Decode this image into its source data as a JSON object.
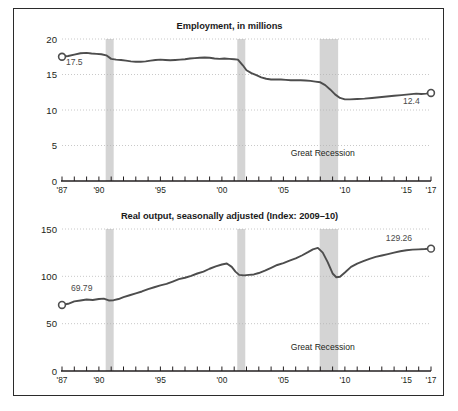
{
  "figure": {
    "background": "#ffffff",
    "frame_color": "#2b2b2b",
    "line_color": "#4d4d4d",
    "recession_band_color": "#d4d4d4",
    "grid_color": "#b3b3b3"
  },
  "chart_data": [
    {
      "id": "employment",
      "type": "line",
      "title": "Employment, in millions",
      "xlabel": "",
      "ylabel": "",
      "xlim": [
        1987,
        2017
      ],
      "ylim": [
        0,
        20
      ],
      "yticks": [
        0,
        5,
        10,
        15,
        20
      ],
      "ytick_labels": [
        "0",
        "5",
        "10",
        "15",
        "20"
      ],
      "xticks": [
        1987,
        1988,
        1989,
        1990,
        1991,
        1992,
        1993,
        1994,
        1995,
        1996,
        1997,
        1998,
        1999,
        2000,
        2001,
        2002,
        2003,
        2004,
        2005,
        2006,
        2007,
        2008,
        2009,
        2010,
        2011,
        2012,
        2013,
        2014,
        2015,
        2016,
        2017
      ],
      "xtick_labels": [
        {
          "x": 1987,
          "label": "'87"
        },
        {
          "x": 1990,
          "label": "'90"
        },
        {
          "x": 1995,
          "label": "'95"
        },
        {
          "x": 2000,
          "label": "'00"
        },
        {
          "x": 2005,
          "label": "'05"
        },
        {
          "x": 2010,
          "label": "'10"
        },
        {
          "x": 2015,
          "label": "'15"
        },
        {
          "x": 2017,
          "label": "'17"
        }
      ],
      "grid": "horizontal-dotted",
      "legend": "none",
      "annotations": [
        {
          "name": "start-value",
          "text": "17.5",
          "x": 1988.0,
          "y": 16.3,
          "anchor": "middle"
        },
        {
          "name": "end-value",
          "text": "12.4",
          "x": 2015.4,
          "y": 10.8,
          "anchor": "middle"
        },
        {
          "name": "recession-label",
          "text": "Great Recession",
          "x": 2008.2,
          "y": 3.5,
          "anchor": "middle"
        }
      ],
      "markers": [
        {
          "name": "start-marker",
          "x": 1987.0,
          "y": 17.5
        },
        {
          "name": "end-marker",
          "x": 2017.0,
          "y": 12.4
        }
      ],
      "recession_bands": [
        {
          "start": 1990.55,
          "end": 1991.2
        },
        {
          "start": 2001.25,
          "end": 2001.9
        },
        {
          "start": 2007.95,
          "end": 2009.45
        }
      ],
      "series": [
        {
          "name": "Employment, in millions",
          "x": [
            1987.0,
            1987.5,
            1988.0,
            1988.5,
            1989.0,
            1989.4,
            1989.8,
            1990.2,
            1990.6,
            1991.0,
            1991.4,
            1991.8,
            1992.2,
            1992.6,
            1993.0,
            1993.4,
            1993.8,
            1994.2,
            1994.6,
            1995.0,
            1995.4,
            1995.8,
            1996.2,
            1996.6,
            1997.0,
            1997.4,
            1997.8,
            1998.2,
            1998.6,
            1999.0,
            1999.4,
            1999.8,
            2000.2,
            2000.6,
            2001.0,
            2001.3,
            2001.7,
            2002.0,
            2002.4,
            2002.8,
            2003.2,
            2003.6,
            2004.0,
            2004.4,
            2004.8,
            2005.2,
            2005.6,
            2006.0,
            2006.4,
            2006.8,
            2007.2,
            2007.6,
            2008.0,
            2008.4,
            2008.8,
            2009.2,
            2009.6,
            2010.0,
            2010.4,
            2011.0,
            2011.6,
            2012.2,
            2012.8,
            2013.4,
            2014.0,
            2014.6,
            2015.2,
            2015.8,
            2016.2,
            2016.6,
            2017.0
          ],
          "y": [
            17.5,
            17.6,
            17.8,
            18.0,
            18.05,
            17.95,
            17.9,
            17.85,
            17.7,
            17.2,
            17.1,
            17.05,
            16.95,
            16.85,
            16.8,
            16.8,
            16.85,
            16.95,
            17.05,
            17.1,
            17.05,
            17.0,
            17.05,
            17.1,
            17.15,
            17.25,
            17.3,
            17.35,
            17.4,
            17.35,
            17.25,
            17.2,
            17.25,
            17.2,
            17.15,
            17.1,
            16.3,
            15.6,
            15.2,
            14.9,
            14.6,
            14.4,
            14.3,
            14.3,
            14.3,
            14.25,
            14.2,
            14.2,
            14.2,
            14.15,
            14.1,
            14.0,
            13.9,
            13.5,
            12.9,
            12.2,
            11.7,
            11.5,
            11.5,
            11.55,
            11.6,
            11.7,
            11.8,
            11.9,
            12.0,
            12.1,
            12.2,
            12.3,
            12.25,
            12.3,
            12.4
          ]
        }
      ]
    },
    {
      "id": "real-output",
      "type": "line",
      "title": "Real output, seasonally adjusted (Index: 2009–10)",
      "xlabel": "",
      "ylabel": "",
      "xlim": [
        1987,
        2017
      ],
      "ylim": [
        0,
        150
      ],
      "yticks": [
        0,
        50,
        100,
        150
      ],
      "ytick_labels": [
        "0",
        "50",
        "100",
        "150"
      ],
      "xticks": [
        1987,
        1988,
        1989,
        1990,
        1991,
        1992,
        1993,
        1994,
        1995,
        1996,
        1997,
        1998,
        1999,
        2000,
        2001,
        2002,
        2003,
        2004,
        2005,
        2006,
        2007,
        2008,
        2009,
        2010,
        2011,
        2012,
        2013,
        2014,
        2015,
        2016,
        2017
      ],
      "xtick_labels": [
        {
          "x": 1987,
          "label": "'87"
        },
        {
          "x": 1990,
          "label": "'90"
        },
        {
          "x": 1995,
          "label": "'95"
        },
        {
          "x": 2000,
          "label": "'00"
        },
        {
          "x": 2005,
          "label": "'05"
        },
        {
          "x": 2010,
          "label": "'10"
        },
        {
          "x": 2015,
          "label": "'15"
        },
        {
          "x": 2017,
          "label": "'17"
        }
      ],
      "grid": "horizontal-dotted",
      "legend": "none",
      "annotations": [
        {
          "name": "start-value",
          "text": "69.79",
          "x": 1988.6,
          "y": 84.0,
          "anchor": "middle"
        },
        {
          "name": "end-value",
          "text": "129.26",
          "x": 2014.4,
          "y": 137.0,
          "anchor": "middle"
        },
        {
          "name": "recession-label",
          "text": "Great Recession",
          "x": 2008.2,
          "y": 22.0,
          "anchor": "middle"
        }
      ],
      "markers": [
        {
          "name": "start-marker",
          "x": 1987.0,
          "y": 69.79
        },
        {
          "name": "end-marker",
          "x": 2017.0,
          "y": 129.26
        }
      ],
      "recession_bands": [
        {
          "start": 1990.55,
          "end": 1991.2
        },
        {
          "start": 2001.25,
          "end": 2001.9
        },
        {
          "start": 2007.95,
          "end": 2009.45
        }
      ],
      "series": [
        {
          "name": "Real output index",
          "x": [
            1987.0,
            1987.5,
            1988.0,
            1988.5,
            1989.0,
            1989.5,
            1990.0,
            1990.4,
            1990.8,
            1991.2,
            1991.6,
            1992.0,
            1992.5,
            1993.0,
            1993.5,
            1994.0,
            1994.5,
            1995.0,
            1995.5,
            1996.0,
            1996.5,
            1997.0,
            1997.5,
            1998.0,
            1998.5,
            1999.0,
            1999.5,
            2000.0,
            2000.4,
            2000.8,
            2001.1,
            2001.4,
            2001.8,
            2002.2,
            2002.6,
            2003.0,
            2003.5,
            2004.0,
            2004.5,
            2005.0,
            2005.5,
            2006.0,
            2006.5,
            2007.0,
            2007.4,
            2007.8,
            2008.2,
            2008.6,
            2009.0,
            2009.3,
            2009.6,
            2010.0,
            2010.5,
            2011.0,
            2011.5,
            2012.0,
            2012.5,
            2013.0,
            2013.5,
            2014.0,
            2014.5,
            2015.0,
            2015.5,
            2016.0,
            2016.5,
            2017.0
          ],
          "y": [
            69.79,
            71.0,
            73.5,
            74.5,
            75.5,
            75.0,
            76.0,
            76.5,
            74.5,
            74.8,
            76.0,
            78.0,
            80.0,
            82.0,
            84.0,
            86.5,
            88.5,
            90.5,
            92.0,
            94.5,
            97.0,
            98.5,
            100.5,
            103.0,
            105.0,
            108.0,
            110.5,
            112.5,
            113.5,
            110.0,
            105.0,
            101.5,
            101.0,
            101.5,
            102.0,
            103.5,
            106.0,
            109.0,
            112.0,
            114.0,
            116.5,
            119.0,
            122.0,
            125.5,
            128.5,
            130.0,
            125.0,
            115.0,
            103.0,
            99.0,
            99.5,
            104.0,
            110.0,
            113.5,
            116.0,
            118.5,
            120.5,
            122.0,
            123.5,
            125.0,
            126.5,
            127.5,
            128.2,
            128.5,
            128.8,
            129.26
          ]
        }
      ]
    }
  ]
}
